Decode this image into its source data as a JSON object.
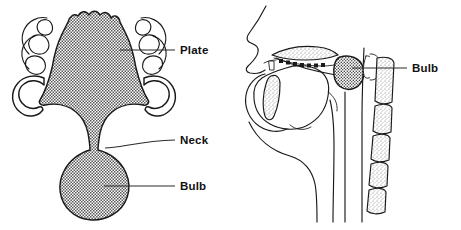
{
  "figure": {
    "background_color": "#ffffff",
    "ink_color": "#1a1a1a",
    "label_color": "#111111",
    "width": 461,
    "height": 230
  },
  "panels": [
    {
      "id": "palatal-view",
      "name": "Palatal view of speech bulb obturator",
      "labels": [
        {
          "id": "plate",
          "text": "Plate",
          "x": 180,
          "y": 54,
          "leader_from_x": 120,
          "leader_from_y": 50,
          "leader_to_x": 175,
          "leader_to_y": 50
        },
        {
          "id": "neck",
          "text": "Neck",
          "x": 180,
          "y": 144,
          "leader_from_x": 105,
          "leader_from_y": 148,
          "leader_to_x": 175,
          "leader_to_y": 140
        },
        {
          "id": "bulb",
          "text": "Bulb",
          "x": 180,
          "y": 190,
          "leader_from_x": 104,
          "leader_from_y": 186,
          "leader_to_x": 175,
          "leader_to_y": 186
        }
      ],
      "parts": [
        {
          "id": "acrylic-plate",
          "name": "acrylic palatal plate",
          "fill": "checker"
        },
        {
          "id": "neck-connector",
          "name": "neck connector",
          "fill": "checker"
        },
        {
          "id": "speech-bulb",
          "name": "speech bulb",
          "fill": "checker"
        },
        {
          "id": "left-clasps",
          "name": "left retentive clasps and teeth",
          "fill": "white"
        },
        {
          "id": "right-clasps",
          "name": "right retentive clasps and teeth",
          "fill": "white"
        }
      ]
    },
    {
      "id": "sagittal-view",
      "name": "Mid-sagittal head section with obturator in place",
      "labels": [
        {
          "id": "bulb",
          "text": "Bulb",
          "x": 412,
          "y": 72,
          "leader_from_x": 352,
          "leader_from_y": 68,
          "leader_to_x": 407,
          "leader_to_y": 68
        }
      ],
      "parts": [
        {
          "id": "facial-profile",
          "name": "facial profile with nose and lips",
          "fill": "none"
        },
        {
          "id": "hard-palate",
          "name": "hard palate with maxillary teeth",
          "fill": "stipple"
        },
        {
          "id": "tongue",
          "name": "tongue",
          "fill": "none"
        },
        {
          "id": "mandible-incisor",
          "name": "mandibular incisor region",
          "fill": "stipple"
        },
        {
          "id": "speech-bulb",
          "name": "speech bulb in nasopharynx",
          "fill": "dense-check"
        },
        {
          "id": "cervical-vertebrae",
          "name": "cervical vertebrae",
          "fill": "stipple",
          "count": 5
        },
        {
          "id": "pharyngeal-wall",
          "name": "posterior pharyngeal wall",
          "fill": "none"
        }
      ]
    }
  ]
}
